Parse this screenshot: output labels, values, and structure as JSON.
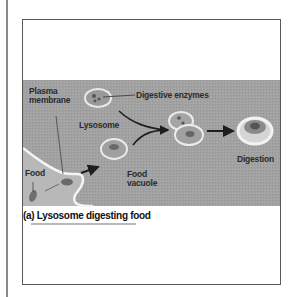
{
  "figure": {
    "caption": "(a) Lysosome digesting food",
    "labels": {
      "plasma_membrane_line1": "Plasma",
      "plasma_membrane_line2": "membrane",
      "digestive_enzymes": "Digestive enzymes",
      "lysosome": "Lysosome",
      "food": "Food",
      "food_vacuole_line1": "Food",
      "food_vacuole_line2": "vacuole",
      "digestion": "Digestion"
    },
    "colors": {
      "band": "#9c9c9c",
      "cell_interior": "#b5b5b5",
      "membrane": "#f2f2f2",
      "vesicle_rim": "#e6e6e6",
      "arrow": "#1e1e1e",
      "frame": "#5a5a5a"
    }
  }
}
